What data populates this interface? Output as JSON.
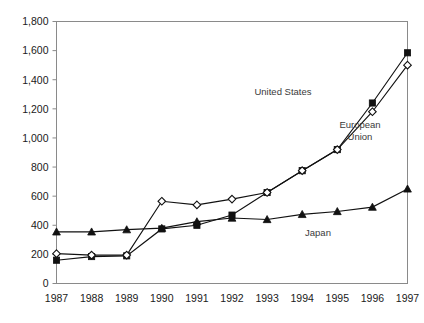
{
  "chart_data": {
    "type": "line",
    "title": "",
    "subtitle": "",
    "xlabel": "",
    "ylabel": "",
    "categories": [
      "1987",
      "1988",
      "1989",
      "1990",
      "1991",
      "1992",
      "1993",
      "1994",
      "1995",
      "1996",
      "1997"
    ],
    "x": [
      1987,
      1988,
      1989,
      1990,
      1991,
      1992,
      1993,
      1994,
      1995,
      1996,
      1997
    ],
    "ylim": [
      0,
      1800
    ],
    "xlim": [
      1987,
      1997
    ],
    "y_ticks": [
      0,
      200,
      400,
      600,
      800,
      1000,
      1200,
      1400,
      1600,
      1800
    ],
    "y_tick_labels": [
      "0",
      "200",
      "400",
      "600",
      "800",
      "1,000",
      "1,200",
      "1,400",
      "1,600",
      "1,800"
    ],
    "grid": false,
    "legend_position": "inline-annotations",
    "series": [
      {
        "name": "United States",
        "marker": "filled-square",
        "color": "#111111",
        "values": [
          160,
          185,
          190,
          375,
          400,
          470,
          625,
          775,
          920,
          1240,
          1585
        ]
      },
      {
        "name": "European Union",
        "marker": "open-diamond",
        "color": "#111111",
        "values": [
          205,
          195,
          195,
          565,
          540,
          580,
          625,
          775,
          920,
          1180,
          1500
        ]
      },
      {
        "name": "Japan",
        "marker": "filled-triangle",
        "color": "#111111",
        "values": [
          355,
          355,
          370,
          380,
          425,
          450,
          440,
          475,
          495,
          525,
          650
        ]
      }
    ],
    "annotations": [
      {
        "text": "United States",
        "series": "United States",
        "x_px": 283,
        "y_px": 95
      },
      {
        "text": "European",
        "series": "European Union",
        "x_px": 360,
        "y_px": 128
      },
      {
        "text": "Union",
        "series": "European Union",
        "x_px": 360,
        "y_px": 140
      },
      {
        "text": "Japan",
        "series": "Japan",
        "x_px": 318,
        "y_px": 236
      }
    ]
  }
}
